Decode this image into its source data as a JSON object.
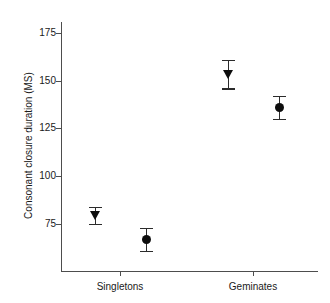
{
  "chart_data": {
    "type": "scatter",
    "title": "",
    "subtitle": "",
    "xlabel": "",
    "ylabel": "Consonant closure duration (MS)",
    "categories": [
      "Singletons",
      "Geminates"
    ],
    "ylim": [
      60,
      182
    ],
    "yticks": [
      75,
      100,
      125,
      150,
      175
    ],
    "ytick_labels": [
      "75",
      "100",
      "125",
      "150",
      "175"
    ],
    "grid": false,
    "legend": null,
    "points": [
      {
        "label": "Singletons-triangle",
        "category": "Singletons",
        "marker": "triangle-down",
        "x_px": 95,
        "value": 79.5,
        "err_low": 75.0,
        "err_high": 84.0
      },
      {
        "label": "Singletons-circle",
        "category": "Singletons",
        "marker": "circle",
        "x_px": 146,
        "value": 67.0,
        "err_low": 61.0,
        "err_high": 73.0
      },
      {
        "label": "Geminates-triangle",
        "category": "Geminates",
        "marker": "triangle-down",
        "x_px": 228,
        "value": 153.5,
        "err_low": 146.0,
        "err_high": 161.0
      },
      {
        "label": "Geminates-circle",
        "category": "Geminates",
        "marker": "circle",
        "x_px": 279,
        "value": 136.0,
        "err_low": 130.0,
        "err_high": 142.0
      }
    ]
  },
  "axes": {
    "y_title": "Consonant closure duration (MS)",
    "y_ticks": [
      {
        "label": "175",
        "y_px": 33
      },
      {
        "label": "150",
        "y_px": 81
      },
      {
        "label": "125",
        "y_px": 128
      },
      {
        "label": "100",
        "y_px": 176
      },
      {
        "label": "75",
        "y_px": 224
      }
    ],
    "x_ticks": [
      {
        "label": "Singletons",
        "x_px": 120
      },
      {
        "label": "Geminates",
        "x_px": 253
      }
    ]
  },
  "colors": {
    "axis": "#4d4d4d",
    "marker": "#0d0d0d",
    "errorbar": "#2b2b2b",
    "text": "#1a1a1a",
    "background": "#ffffff"
  }
}
